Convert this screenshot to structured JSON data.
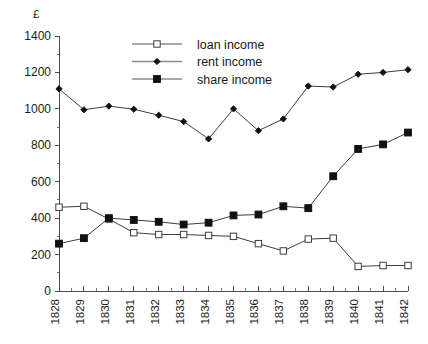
{
  "chart_data": {
    "type": "line",
    "title": "",
    "subtitle": "",
    "xlabel": "",
    "ylabel": "£",
    "unit_label": "£",
    "grid": false,
    "legend_position": "top-center",
    "x": [
      "1828",
      "1829",
      "1830",
      "1831",
      "1832",
      "1833",
      "1834",
      "1835",
      "1836",
      "1837",
      "1838",
      "1839",
      "1840",
      "1841",
      "1842"
    ],
    "categories": [
      "1828",
      "1829",
      "1830",
      "1831",
      "1832",
      "1833",
      "1834",
      "1835",
      "1836",
      "1837",
      "1838",
      "1839",
      "1840",
      "1841",
      "1842"
    ],
    "xlim": [
      1828,
      1842
    ],
    "ylim": [
      0,
      1400
    ],
    "ytick_labels": [
      "0",
      "200",
      "400",
      "600",
      "800",
      "1000",
      "1200",
      "1400"
    ],
    "ytick_values": [
      0,
      200,
      400,
      600,
      800,
      1000,
      1200,
      1400
    ],
    "ytick_step": 200,
    "yminor_step": 100,
    "series": [
      {
        "name": "loan income",
        "marker": "open-square",
        "values": [
          460,
          465,
          395,
          320,
          310,
          310,
          305,
          300,
          260,
          220,
          285,
          290,
          135,
          140,
          140
        ]
      },
      {
        "name": "rent income",
        "marker": "filled-diamond",
        "values": [
          1110,
          995,
          1015,
          998,
          965,
          930,
          835,
          1000,
          880,
          945,
          1125,
          1120,
          1190,
          1200,
          1215
        ]
      },
      {
        "name": "share income",
        "marker": "filled-square",
        "values": [
          260,
          290,
          400,
          390,
          380,
          365,
          375,
          415,
          420,
          465,
          455,
          630,
          780,
          805,
          870
        ]
      }
    ]
  },
  "legend": {
    "items": [
      {
        "label": "loan income",
        "marker": "open-square"
      },
      {
        "label": "rent income",
        "marker": "filled-diamond"
      },
      {
        "label": "share income",
        "marker": "filled-square"
      }
    ]
  }
}
